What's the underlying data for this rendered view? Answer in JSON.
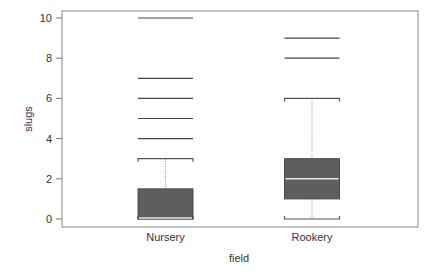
{
  "chart_data": {
    "type": "boxplot",
    "title": "",
    "xlabel": "field",
    "ylabel": "slugs",
    "ylim": [
      0,
      10
    ],
    "yticks": [
      0,
      2,
      4,
      6,
      8,
      10
    ],
    "grid": false,
    "legend": null,
    "categories": [
      "Nursery",
      "Rookery"
    ],
    "series": [
      {
        "name": "Nursery",
        "whisker_low": 0,
        "q1": 0,
        "median": 0,
        "q3": 1.5,
        "whisker_high": 3,
        "outliers": [
          4,
          5,
          6,
          7,
          10
        ]
      },
      {
        "name": "Rookery",
        "whisker_low": 0,
        "q1": 1,
        "median": 2,
        "q3": 3,
        "whisker_high": 6,
        "outliers": [
          8,
          9
        ]
      }
    ],
    "colors": {
      "box_fill": "#5e5e5e",
      "median_line": "#e8e8e8",
      "outlier_line": "#444444",
      "axis": "#777777"
    }
  }
}
